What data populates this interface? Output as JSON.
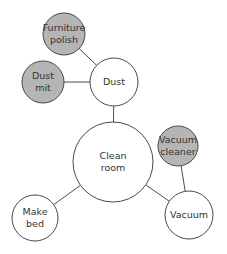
{
  "diagram": {
    "type": "mind-map",
    "colors": {
      "stroke": "#4a4a4a",
      "line": "#4a4a4a",
      "filled": "#b5b5b5",
      "empty": "#ffffff",
      "text": "#333333"
    },
    "nodes": [
      {
        "id": "furniture-polish",
        "lines": [
          "Furniture",
          "polish"
        ],
        "cx": 64,
        "cy": 34,
        "r": 21,
        "filled": true
      },
      {
        "id": "dust-mit",
        "lines": [
          "Dust",
          "mit"
        ],
        "cx": 43,
        "cy": 82,
        "r": 21,
        "filled": true
      },
      {
        "id": "dust",
        "lines": [
          "Dust"
        ],
        "cx": 114,
        "cy": 82,
        "r": 24,
        "filled": false
      },
      {
        "id": "clean-room",
        "lines": [
          "Clean",
          "room"
        ],
        "cx": 113,
        "cy": 162,
        "r": 40,
        "filled": false
      },
      {
        "id": "vacuum-cleaner",
        "lines": [
          "Vacuum",
          "cleaner"
        ],
        "cx": 178,
        "cy": 146,
        "r": 20,
        "filled": true
      },
      {
        "id": "make-bed",
        "lines": [
          "Make",
          "bed"
        ],
        "cx": 35,
        "cy": 218,
        "r": 23,
        "filled": false
      },
      {
        "id": "vacuum",
        "lines": [
          "Vacuum"
        ],
        "cx": 189,
        "cy": 215,
        "r": 24,
        "filled": false
      }
    ],
    "edges": [
      {
        "from": "furniture-polish",
        "to": "dust"
      },
      {
        "from": "dust-mit",
        "to": "dust"
      },
      {
        "from": "dust",
        "to": "clean-room"
      },
      {
        "from": "clean-room",
        "to": "make-bed"
      },
      {
        "from": "clean-room",
        "to": "vacuum"
      },
      {
        "from": "vacuum-cleaner",
        "to": "vacuum"
      }
    ]
  }
}
